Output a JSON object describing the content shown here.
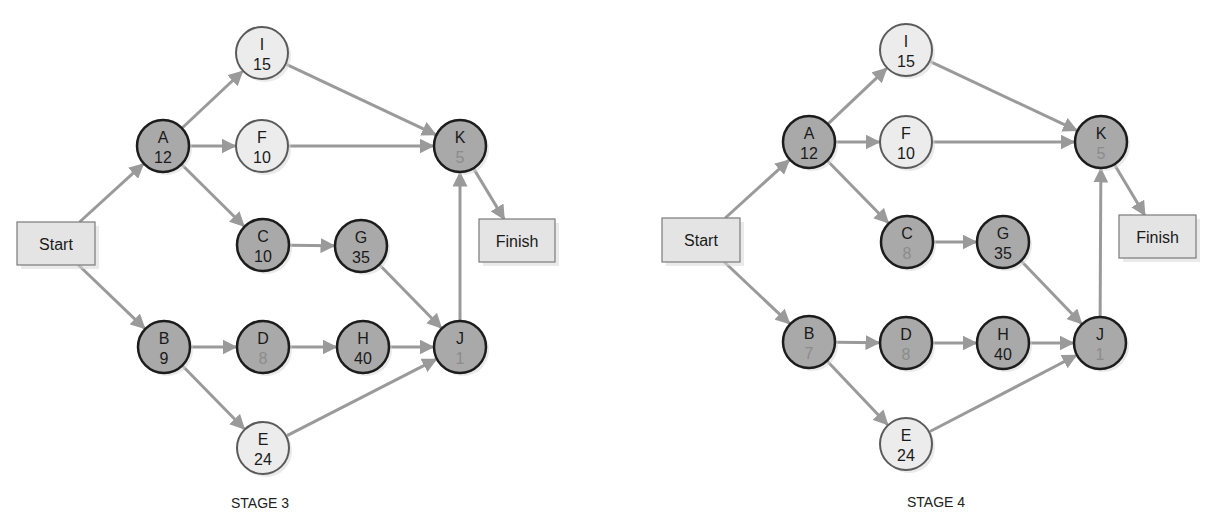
{
  "colors": {
    "edge": "#9a9a9a",
    "critical_fill": "#a9a9a9",
    "normal_fill": "#ececec",
    "box_fill": "#e4e4e4",
    "faded_value": "#8c8c8c"
  },
  "diagrams": [
    {
      "id": "stage3",
      "title": "STAGE 3",
      "title_pos": [
        260,
        503
      ],
      "start": {
        "label": "Start",
        "x": 17,
        "y": 222,
        "w": 78,
        "h": 43
      },
      "finish": {
        "label": "Finish",
        "x": 479,
        "y": 219,
        "w": 76,
        "h": 43
      },
      "nodes": [
        {
          "id": "A",
          "label": "A",
          "value": "12",
          "cx": 163,
          "cy": 146,
          "critical": true,
          "faded": false
        },
        {
          "id": "I",
          "label": "I",
          "value": "15",
          "cx": 262,
          "cy": 53,
          "critical": false,
          "faded": false
        },
        {
          "id": "F",
          "label": "F",
          "value": "10",
          "cx": 262,
          "cy": 146,
          "critical": false,
          "faded": false
        },
        {
          "id": "C",
          "label": "C",
          "value": "10",
          "cx": 263,
          "cy": 245,
          "critical": true,
          "faded": false
        },
        {
          "id": "G",
          "label": "G",
          "value": "35",
          "cx": 361,
          "cy": 246,
          "critical": true,
          "faded": false
        },
        {
          "id": "K",
          "label": "K",
          "value": "5",
          "cx": 460,
          "cy": 146,
          "critical": true,
          "faded": true
        },
        {
          "id": "B",
          "label": "B",
          "value": "9",
          "cx": 164,
          "cy": 347,
          "critical": true,
          "faded": false
        },
        {
          "id": "D",
          "label": "D",
          "value": "8",
          "cx": 263,
          "cy": 347,
          "critical": true,
          "faded": true
        },
        {
          "id": "H",
          "label": "H",
          "value": "40",
          "cx": 363,
          "cy": 347,
          "critical": true,
          "faded": false
        },
        {
          "id": "J",
          "label": "J",
          "value": "1",
          "cx": 460,
          "cy": 347,
          "critical": true,
          "faded": true
        },
        {
          "id": "E",
          "label": "E",
          "value": "24",
          "cx": 263,
          "cy": 448,
          "critical": false,
          "faded": false
        }
      ],
      "edges": [
        [
          "Start",
          "A"
        ],
        [
          "Start",
          "B"
        ],
        [
          "A",
          "I"
        ],
        [
          "A",
          "F"
        ],
        [
          "A",
          "C"
        ],
        [
          "I",
          "K"
        ],
        [
          "F",
          "K"
        ],
        [
          "C",
          "G"
        ],
        [
          "G",
          "J"
        ],
        [
          "B",
          "D"
        ],
        [
          "B",
          "E"
        ],
        [
          "D",
          "H"
        ],
        [
          "H",
          "J"
        ],
        [
          "E",
          "J"
        ],
        [
          "J",
          "K"
        ],
        [
          "K",
          "Finish"
        ]
      ]
    },
    {
      "id": "stage4",
      "title": "STAGE 4",
      "title_pos": [
        936,
        502
      ],
      "start": {
        "label": "Start",
        "x": 662,
        "y": 218,
        "w": 78,
        "h": 44
      },
      "finish": {
        "label": "Finish",
        "x": 1119,
        "y": 215,
        "w": 77,
        "h": 43
      },
      "nodes": [
        {
          "id": "A",
          "label": "A",
          "value": "12",
          "cx": 809,
          "cy": 142,
          "critical": true,
          "faded": false
        },
        {
          "id": "I",
          "label": "I",
          "value": "15",
          "cx": 906,
          "cy": 50,
          "critical": false,
          "faded": false
        },
        {
          "id": "F",
          "label": "F",
          "value": "10",
          "cx": 906,
          "cy": 142,
          "critical": false,
          "faded": false
        },
        {
          "id": "C",
          "label": "C",
          "value": "8",
          "cx": 907,
          "cy": 242,
          "critical": true,
          "faded": true
        },
        {
          "id": "G",
          "label": "G",
          "value": "35",
          "cx": 1003,
          "cy": 242,
          "critical": true,
          "faded": false
        },
        {
          "id": "K",
          "label": "K",
          "value": "5",
          "cx": 1101,
          "cy": 142,
          "critical": true,
          "faded": true
        },
        {
          "id": "B",
          "label": "B",
          "value": "7",
          "cx": 809,
          "cy": 342,
          "critical": true,
          "faded": true
        },
        {
          "id": "D",
          "label": "D",
          "value": "8",
          "cx": 906,
          "cy": 343,
          "critical": true,
          "faded": true
        },
        {
          "id": "H",
          "label": "H",
          "value": "40",
          "cx": 1003,
          "cy": 343,
          "critical": true,
          "faded": false
        },
        {
          "id": "J",
          "label": "J",
          "value": "1",
          "cx": 1100,
          "cy": 343,
          "critical": true,
          "faded": true
        },
        {
          "id": "E",
          "label": "E",
          "value": "24",
          "cx": 906,
          "cy": 444,
          "critical": false,
          "faded": false
        }
      ],
      "edges": [
        [
          "Start",
          "A"
        ],
        [
          "Start",
          "B"
        ],
        [
          "A",
          "I"
        ],
        [
          "A",
          "F"
        ],
        [
          "A",
          "C"
        ],
        [
          "I",
          "K"
        ],
        [
          "F",
          "K"
        ],
        [
          "C",
          "G"
        ],
        [
          "G",
          "J"
        ],
        [
          "B",
          "D"
        ],
        [
          "B",
          "E"
        ],
        [
          "D",
          "H"
        ],
        [
          "H",
          "J"
        ],
        [
          "E",
          "J"
        ],
        [
          "J",
          "K"
        ],
        [
          "K",
          "Finish"
        ]
      ]
    }
  ]
}
